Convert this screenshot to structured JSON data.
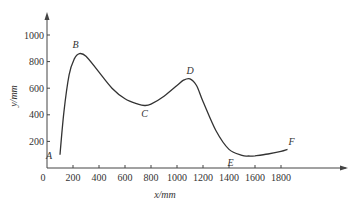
{
  "chart_data": {
    "type": "line",
    "title": "",
    "xlabel": "x/mm",
    "ylabel": "y/mm",
    "xlim": [
      0,
      2000
    ],
    "ylim": [
      0,
      1100
    ],
    "grid": false,
    "legend": null,
    "x_ticks": [
      0,
      200,
      400,
      600,
      800,
      1000,
      1200,
      1400,
      1600,
      1800
    ],
    "y_ticks": [
      200,
      400,
      600,
      800,
      1000
    ],
    "origin_label": "0",
    "series": [
      {
        "name": "curve",
        "x": [
          100,
          130,
          170,
          210,
          250,
          300,
          400,
          500,
          600,
          700,
          750,
          800,
          900,
          1000,
          1050,
          1100,
          1150,
          1200,
          1300,
          1400,
          1500,
          1550,
          1600,
          1700,
          1800,
          1850
        ],
        "y": [
          100,
          420,
          700,
          820,
          860,
          840,
          720,
          600,
          520,
          480,
          470,
          480,
          540,
          620,
          660,
          670,
          620,
          500,
          280,
          140,
          95,
          90,
          92,
          105,
          125,
          140
        ]
      }
    ],
    "annotations": [
      {
        "label": "A",
        "x": 100,
        "y": 100
      },
      {
        "label": "B",
        "x": 250,
        "y": 860
      },
      {
        "label": "C",
        "x": 750,
        "y": 470
      },
      {
        "label": "D",
        "x": 1100,
        "y": 670
      },
      {
        "label": "E",
        "x": 1550,
        "y": 90
      },
      {
        "label": "F",
        "x": 1850,
        "y": 140
      }
    ]
  }
}
